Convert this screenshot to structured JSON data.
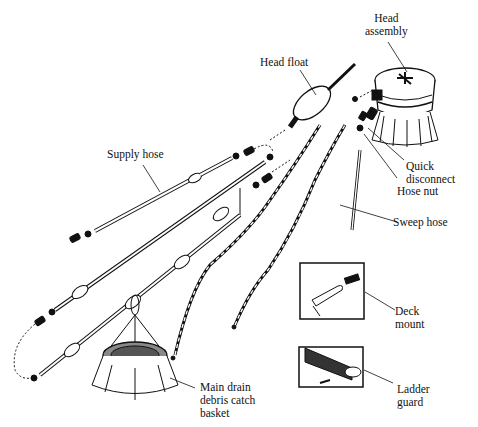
{
  "diagram": {
    "labels": {
      "head_assembly": [
        "Head",
        "assembly"
      ],
      "head_float": "Head float",
      "supply_hose": "Supply hose",
      "quick_disconnect": [
        "Quick",
        "disconnect"
      ],
      "hose_nut": "Hose nut",
      "sweep_hose": "Sweep hose",
      "deck_mount": [
        "Deck",
        "mount"
      ],
      "ladder_guard": [
        "Ladder",
        "guard"
      ],
      "main_drain": [
        "Main drain",
        "debris catch",
        "basket"
      ]
    },
    "colors": {
      "ink": "#111111",
      "background": "#ffffff"
    }
  }
}
